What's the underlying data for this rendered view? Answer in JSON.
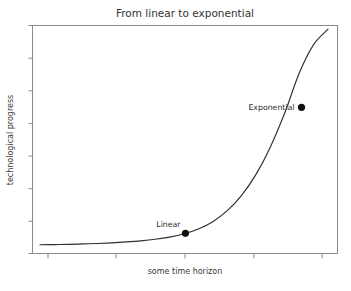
{
  "chart_data": {
    "type": "line",
    "title": "From linear to exponential",
    "xlabel": "some time horizon",
    "ylabel": "technological progress",
    "grid": false,
    "legend": "none",
    "xlim": [
      0,
      10
    ],
    "ylim": [
      0,
      10
    ],
    "x_tick_labels": [],
    "y_tick_labels": [],
    "x_tick_count": 5,
    "y_tick_count": 8,
    "series": [
      {
        "name": "technological progress",
        "color": "#2e2e2e",
        "x": [
          0.0,
          0.5,
          1.0,
          1.5,
          2.0,
          2.5,
          3.0,
          3.5,
          4.0,
          4.5,
          5.0,
          5.5,
          6.0,
          6.5,
          7.0,
          7.5,
          8.0,
          8.5,
          9.0,
          9.5,
          10.0
        ],
        "y": [
          0.1,
          0.11,
          0.12,
          0.14,
          0.16,
          0.19,
          0.23,
          0.28,
          0.35,
          0.45,
          0.6,
          0.82,
          1.15,
          1.65,
          2.35,
          3.3,
          4.55,
          6.1,
          7.9,
          9.2,
          9.9
        ]
      }
    ],
    "annotations": [
      {
        "label": "Linear",
        "x": 5.05,
        "y": 0.62,
        "label_position": "above",
        "marker": "circle",
        "marker_color": "#111111"
      },
      {
        "label": "Exponential",
        "x": 9.08,
        "y": 6.35,
        "label_position": "left",
        "marker": "circle",
        "marker_color": "#111111"
      }
    ]
  },
  "figure": {
    "background_color": "#ffffff",
    "frame_color": "#8a8a8a",
    "title_color": "#333333",
    "label_color": "#3a3a3a"
  }
}
